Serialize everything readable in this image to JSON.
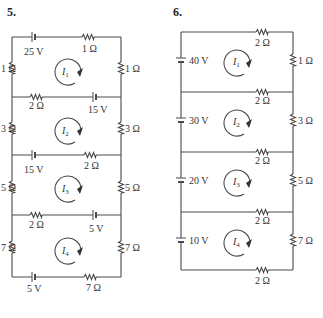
{
  "problems": [
    {
      "number": "5.",
      "loops": [
        {
          "current": "I",
          "sub": "1",
          "top": {
            "battery": "25 V",
            "resistor": "1 Ω"
          },
          "left": "1 Ω",
          "right": "1 Ω"
        },
        {
          "current": "I",
          "sub": "2",
          "top": {
            "resistor": "2 Ω",
            "battery": "15 V"
          },
          "left": "3 Ω",
          "right": "3 Ω"
        },
        {
          "current": "I",
          "sub": "3",
          "top": {
            "battery": "15 V",
            "resistor": "2 Ω"
          },
          "left": "5 Ω",
          "right": "5 Ω"
        },
        {
          "current": "I",
          "sub": "4",
          "top": {
            "resistor": "2 Ω",
            "battery": "5 V"
          },
          "left": "7 Ω",
          "right": "7 Ω",
          "bottom": {
            "battery": "5 V",
            "resistor": "7 Ω"
          }
        }
      ]
    },
    {
      "number": "6.",
      "loops": [
        {
          "current": "I",
          "sub": "1",
          "battery": "40 V",
          "top_resistor": "2 Ω",
          "right": "1 Ω"
        },
        {
          "current": "I",
          "sub": "2",
          "battery": "30 V",
          "top_resistor": "2 Ω",
          "right": "3 Ω"
        },
        {
          "current": "I",
          "sub": "3",
          "battery": "20 V",
          "top_resistor": "2 Ω",
          "right": "5 Ω"
        },
        {
          "current": "I",
          "sub": "4",
          "battery": "10 V",
          "top_resistor": "2 Ω",
          "right": "7 Ω",
          "bottom_resistor": "2 Ω"
        }
      ]
    }
  ],
  "colors": {
    "wire": "#4a4a4a",
    "text": "#333333",
    "background": "#ffffff"
  }
}
